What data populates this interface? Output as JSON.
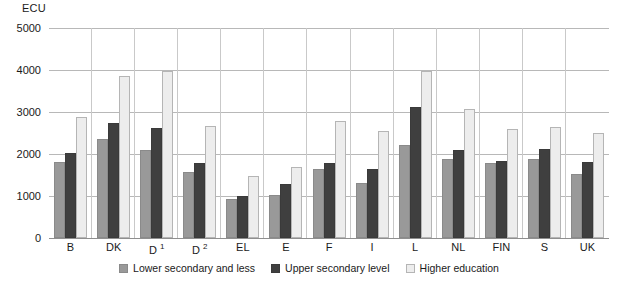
{
  "chart_data": {
    "type": "bar",
    "title": "",
    "subtitle": "",
    "xlabel": "",
    "ylabel": "ECU",
    "ylim": [
      0,
      5000
    ],
    "ytick_values": [
      5000,
      4000,
      3000,
      2000,
      1000,
      0
    ],
    "ytick_labels": [
      "5000",
      "4000",
      "3000",
      "2000",
      "1000",
      "0"
    ],
    "grid": true,
    "legend_position": "bottom",
    "categories": [
      "B",
      "DK",
      "D",
      "D",
      "EL",
      "E",
      "F",
      "I",
      "L",
      "NL",
      "FIN",
      "S",
      "UK"
    ],
    "category_footnotes": [
      "",
      "",
      "1",
      "2",
      "",
      "",
      "",
      "",
      "",
      "",
      "",
      "",
      ""
    ],
    "series": [
      {
        "name": "Lower secondary and less",
        "color": "#999999",
        "values": [
          1800,
          2350,
          2100,
          1570,
          940,
          1030,
          1650,
          1320,
          2220,
          1870,
          1780,
          1880,
          1520
        ]
      },
      {
        "name": "Upper secondary level",
        "color": "#3f3f3f",
        "values": [
          2030,
          2750,
          2620,
          1780,
          990,
          1280,
          1780,
          1650,
          3120,
          2090,
          1830,
          2120,
          1800
        ]
      },
      {
        "name": "Higher education",
        "color": "#ededed",
        "values": [
          2880,
          3850,
          3980,
          2660,
          1470,
          1700,
          2780,
          2540,
          3970,
          3060,
          2600,
          2640,
          2510
        ]
      }
    ]
  }
}
